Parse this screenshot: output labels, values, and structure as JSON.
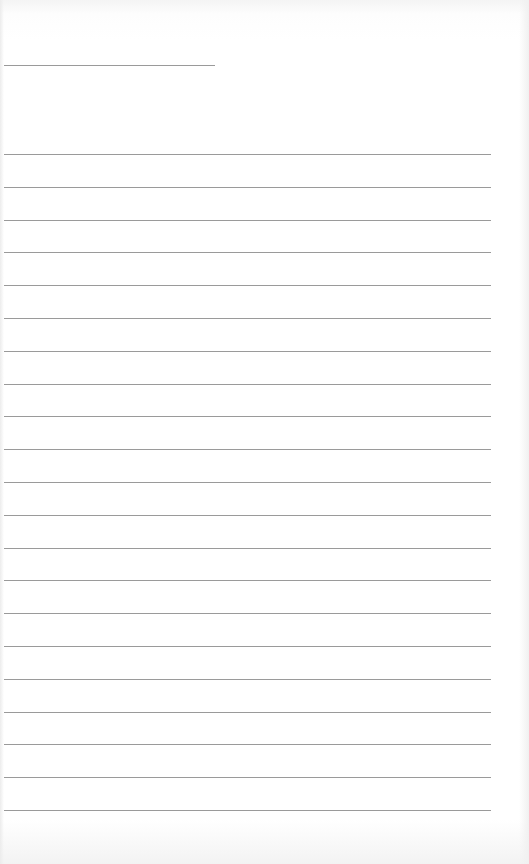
{
  "paper": {
    "type": "lined-notebook-page",
    "header_rule": {
      "x_start": 4,
      "x_end": 215,
      "y": 65
    },
    "rules": {
      "count": 21,
      "x_start": 4,
      "x_end": 491,
      "first_y": 154,
      "last_y": 810
    },
    "colors": {
      "paper": "#ffffff",
      "rule": "#9a9a9a"
    }
  }
}
